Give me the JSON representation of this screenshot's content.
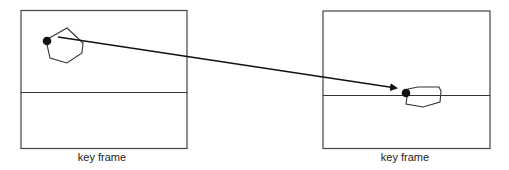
{
  "diagram": {
    "type": "keyframe-interpolation",
    "colors": {
      "stroke": "#333333",
      "dot": "#111111",
      "background": "#ffffff"
    },
    "frames": [
      {
        "id": "left",
        "caption": "key frame",
        "object": "hexagon",
        "anchor_point": "filled-dot"
      },
      {
        "id": "right",
        "caption": "key frame",
        "object": "hexagon (squashed/rotated)",
        "anchor_point": "filled-dot"
      }
    ],
    "arrow": {
      "from": "left-frame-object",
      "to": "right-frame-object"
    }
  }
}
